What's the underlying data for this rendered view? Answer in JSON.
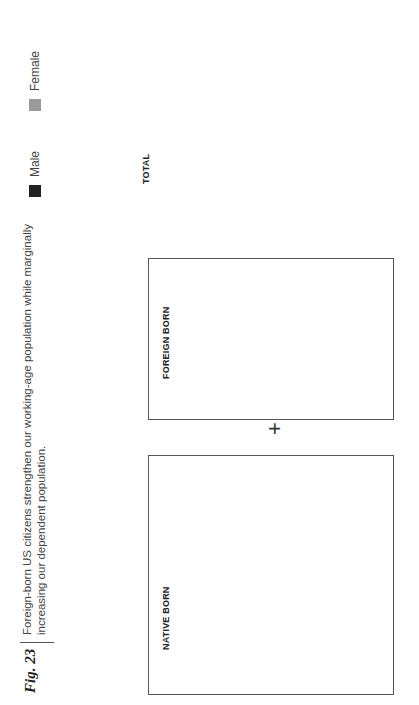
{
  "figure": {
    "label": "Fig. 23",
    "caption": "Foreign-born US citizens strengthen our working-age population while marginally increasing our dependent population."
  },
  "operators": {
    "plus": "+",
    "equals": "="
  },
  "legend": [
    {
      "label": "Male",
      "color": "#222222"
    },
    {
      "label": "Female",
      "color": "#9a9a9a"
    }
  ],
  "age_groups": [
    "85+",
    "80-84",
    "75-79",
    "70-74",
    "65-69",
    "60-64",
    "55-59",
    "50-54",
    "45-49",
    "40-44",
    "35-39",
    "30-34",
    "25-29",
    "20-24",
    "15-19",
    "10-14",
    "5-9",
    "0-4"
  ],
  "axis": {
    "ticks": [
      "4",
      "2",
      "0",
      "2",
      "4"
    ],
    "panel_unit": "%",
    "total_title": "% of total population"
  },
  "chart_data": [
    {
      "type": "bar",
      "title": "NATIVE BORN",
      "orientation": "horizontal-pyramid",
      "categories": [
        "85+",
        "80-84",
        "75-79",
        "70-74",
        "65-69",
        "60-64",
        "55-59",
        "50-54",
        "45-49",
        "40-44",
        "35-39",
        "30-34",
        "25-29",
        "20-24",
        "15-19",
        "10-14",
        "5-9",
        "0-4"
      ],
      "series": [
        {
          "name": "Male",
          "values": [
            0.6,
            0.75,
            1.2,
            1.8,
            2.2,
            2.65,
            2.7,
            2.45,
            2.4,
            2.3,
            2.55,
            2.75,
            3.05,
            2.95,
            3.0,
            3.1,
            2.9,
            2.95
          ]
        },
        {
          "name": "Female",
          "values": [
            1.1,
            1.0,
            1.4,
            2.0,
            2.4,
            2.8,
            2.8,
            2.5,
            2.4,
            2.35,
            2.6,
            2.75,
            3.0,
            2.85,
            2.95,
            3.05,
            2.85,
            2.85
          ]
        }
      ],
      "xlabel": "%",
      "ylabel": "",
      "xlim": [
        -4,
        4
      ],
      "legend_position": "top"
    },
    {
      "type": "bar",
      "title": "FOREIGN BORN",
      "orientation": "horizontal-pyramid",
      "categories": [
        "85+",
        "80-84",
        "75-79",
        "70-74",
        "65-69",
        "60-64",
        "55-59",
        "50-54",
        "45-49",
        "40-44",
        "35-39",
        "30-34",
        "25-29",
        "20-24",
        "15-19",
        "10-14",
        "5-9",
        "0-4"
      ],
      "series": [
        {
          "name": "Male",
          "values": [
            0.15,
            0.15,
            0.2,
            0.28,
            0.36,
            0.46,
            0.56,
            0.64,
            0.7,
            0.72,
            0.7,
            0.62,
            0.48,
            0.32,
            0.2,
            0.12,
            0.1,
            0.05
          ]
        },
        {
          "name": "Female",
          "values": [
            0.18,
            0.18,
            0.25,
            0.3,
            0.4,
            0.5,
            0.58,
            0.66,
            0.72,
            0.72,
            0.7,
            0.6,
            0.48,
            0.34,
            0.22,
            0.12,
            0.1,
            0.05
          ]
        }
      ],
      "xlabel": "%",
      "ylabel": "",
      "xlim": [
        -4,
        4
      ]
    },
    {
      "type": "bar",
      "title": "TOTAL",
      "orientation": "horizontal-pyramid",
      "categories": [
        "85+",
        "80-84",
        "75-79",
        "70-74",
        "65-69",
        "60-64",
        "55-59",
        "50-54",
        "45-49",
        "40-44",
        "35-39",
        "30-34",
        "25-29",
        "20-24",
        "15-19",
        "10-14",
        "5-9",
        "0-4"
      ],
      "series": [
        {
          "name": "Male",
          "values": [
            0.7,
            0.8,
            1.3,
            2.0,
            2.45,
            3.0,
            3.1,
            3.0,
            3.0,
            3.0,
            3.3,
            3.4,
            3.55,
            3.3,
            3.25,
            3.3,
            3.0,
            2.95
          ]
        },
        {
          "name": "Female",
          "values": [
            1.2,
            1.1,
            1.6,
            2.3,
            2.75,
            3.25,
            3.3,
            3.1,
            3.1,
            3.0,
            3.2,
            3.3,
            3.4,
            3.1,
            3.1,
            3.1,
            2.9,
            2.8
          ]
        }
      ],
      "xlabel": "% of total population",
      "ylabel": "",
      "xlim": [
        -4,
        4
      ]
    }
  ]
}
